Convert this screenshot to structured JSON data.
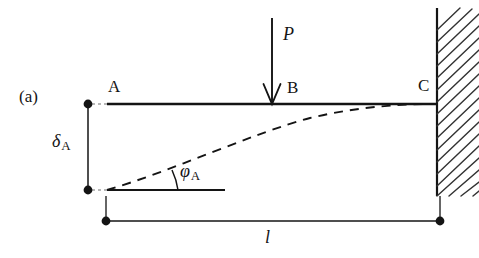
{
  "figure": {
    "panel_label": "(a)",
    "caption_symbols": {
      "load": "P",
      "deflection": "δ",
      "deflection_subscript": "A",
      "rotation": "φ",
      "rotation_subscript": "A",
      "length": "l"
    },
    "nodes": [
      {
        "name": "A",
        "label": "A",
        "x": 88,
        "y": 104,
        "kind": "free-end-dot"
      },
      {
        "name": "B",
        "label": "B",
        "x": 272,
        "y": 104,
        "kind": "load-point"
      },
      {
        "name": "C",
        "label": "C",
        "x": 437,
        "y": 104,
        "kind": "fixed-support"
      }
    ],
    "colors": {
      "ink": "#141414",
      "background": "#ffffff",
      "hatch": "#333333"
    },
    "geometry": {
      "beam_y": 104,
      "beam_x_start": 107,
      "beam_x_end": 437,
      "wall_x": 437,
      "wall_y_top": 8,
      "wall_y_bottom": 196,
      "deflected_end_y": 190,
      "dimension_line_y": 221,
      "dimension_x_start": 106,
      "dimension_x_end": 440
    },
    "annotations": {
      "load_arrow": "downward-arrow-at-B",
      "deflected_shape": "dashed-curve",
      "angle_arc": "phi-A-angle-arc",
      "support": "hatched-fixed-wall"
    }
  }
}
